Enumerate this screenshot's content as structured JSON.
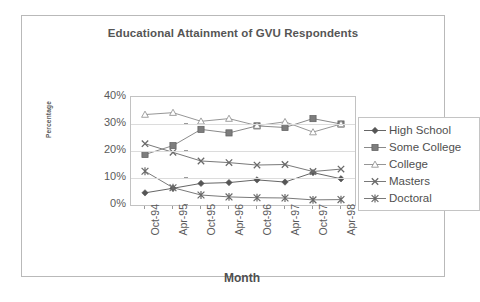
{
  "chart_data": {
    "type": "line",
    "title": "Educational Attainment of GVU Respondents",
    "xlabel": "Month",
    "ylabel": "Percentage",
    "categories": [
      "Oct-94",
      "Apr-95",
      "Oct-95",
      "Apr-96",
      "Oct-96",
      "Apr-97",
      "Oct-97",
      "Apr-98"
    ],
    "ylim": [
      0,
      40
    ],
    "yticks": [
      0,
      10,
      20,
      30,
      40
    ],
    "ytick_labels": [
      "0%",
      "10%",
      "20%",
      "30%",
      "40%"
    ],
    "grid": true,
    "legend_position": "right",
    "series": [
      {
        "name": "High School",
        "marker": "diamond",
        "color": "#555555",
        "values": [
          4.5,
          6.2,
          8.0,
          8.3,
          9.3,
          8.5,
          12.0,
          9.7
        ]
      },
      {
        "name": "Some College",
        "marker": "square",
        "color": "#7d7d7d",
        "values": [
          18.7,
          22.0,
          28.0,
          26.7,
          29.3,
          28.7,
          32.0,
          30.0
        ]
      },
      {
        "name": "College",
        "marker": "triangle-open",
        "color": "#8a8a8a",
        "values": [
          33.5,
          34.2,
          31.0,
          32.0,
          29.4,
          30.8,
          27.0,
          30.0
        ]
      },
      {
        "name": "Masters",
        "marker": "x",
        "color": "#6a6a6a",
        "values": [
          22.7,
          19.5,
          16.3,
          15.7,
          14.8,
          15.0,
          12.4,
          13.3
        ]
      },
      {
        "name": "Doctoral",
        "marker": "star",
        "color": "#6a6a6a",
        "values": [
          12.5,
          6.4,
          3.7,
          3.0,
          2.7,
          2.6,
          1.9,
          2.0
        ]
      }
    ]
  }
}
